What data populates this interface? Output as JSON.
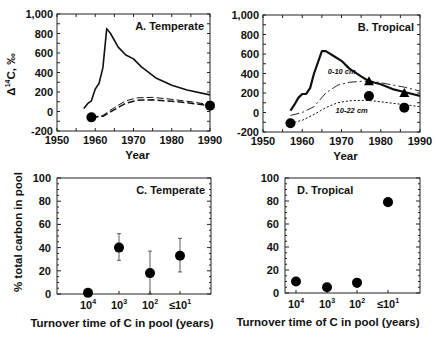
{
  "chart_data": [
    {
      "id": "A",
      "type": "line",
      "title": "A. Temperate",
      "xlabel": "Year",
      "ylabel": "Δ14C, ‰",
      "xlim": [
        1950,
        1990
      ],
      "ylim": [
        -200,
        1000
      ],
      "xticks": [
        "1950",
        "1960",
        "1970",
        "1980",
        "1990"
      ],
      "yticks": [
        "-200",
        "0",
        "200",
        "400",
        "600",
        "800",
        "1,000"
      ],
      "series": [
        {
          "name": "Atmospheric 14CO2",
          "style": "solid",
          "x": [
            1957,
            1958,
            1959,
            1960,
            1961,
            1962,
            1963,
            1964,
            1966,
            1968,
            1970,
            1972,
            1976,
            1980,
            1984,
            1990
          ],
          "y": [
            30,
            80,
            110,
            230,
            290,
            450,
            850,
            800,
            660,
            580,
            540,
            460,
            340,
            270,
            220,
            170
          ]
        },
        {
          "name": "Model pool (upper)",
          "style": "dashed-double",
          "x": [
            1959,
            1962,
            1965,
            1968,
            1971,
            1975,
            1980,
            1985,
            1990
          ],
          "y": [
            -60,
            -40,
            40,
            110,
            140,
            145,
            125,
            100,
            70
          ]
        },
        {
          "name": "Model pool (lower)",
          "style": "dashed",
          "x": [
            1959,
            1962,
            1965,
            1968,
            1971,
            1975,
            1980,
            1985,
            1990
          ],
          "y": [
            -60,
            -50,
            20,
            85,
            115,
            120,
            105,
            85,
            60
          ]
        },
        {
          "name": "Measured soil",
          "style": "marker-circle",
          "x": [
            1959,
            1990
          ],
          "y": [
            -60,
            60
          ]
        }
      ]
    },
    {
      "id": "B",
      "type": "line",
      "title": "B. Tropical",
      "xlabel": "Year",
      "ylabel": "",
      "xlim": [
        1950,
        1990
      ],
      "ylim": [
        -200,
        1000
      ],
      "xticks": [
        "1950",
        "1960",
        "1970",
        "1980",
        "1990"
      ],
      "yticks": [
        "-200",
        "0",
        "200",
        "400",
        "600",
        "800",
        "1,000"
      ],
      "annotations": [
        "0-10  cm",
        "10-22  cm"
      ],
      "series": [
        {
          "name": "Atmospheric 14CO2",
          "style": "solid-bold",
          "x": [
            1957,
            1958,
            1959,
            1960,
            1961,
            1962,
            1963,
            1965,
            1966,
            1968,
            1970,
            1972,
            1975,
            1977,
            1980,
            1983,
            1986,
            1990
          ],
          "y": [
            20,
            80,
            150,
            190,
            190,
            250,
            400,
            630,
            630,
            580,
            530,
            450,
            370,
            320,
            290,
            240,
            210,
            170
          ]
        },
        {
          "name": "0-10 cm model",
          "style": "long-dash",
          "x": [
            1957,
            1960,
            1963,
            1966,
            1969,
            1972,
            1975,
            1978,
            1982,
            1986,
            1990
          ],
          "y": [
            -30,
            0,
            60,
            200,
            280,
            310,
            320,
            320,
            290,
            260,
            220
          ]
        },
        {
          "name": "10-22 cm model",
          "style": "dotted",
          "x": [
            1957,
            1960,
            1963,
            1966,
            1969,
            1972,
            1975,
            1978,
            1982,
            1986,
            1990
          ],
          "y": [
            -110,
            -80,
            -20,
            50,
            100,
            120,
            125,
            120,
            100,
            80,
            60
          ]
        },
        {
          "name": "0-10 cm measured",
          "style": "marker-triangle",
          "x": [
            1977,
            1986
          ],
          "y": [
            320,
            200
          ]
        },
        {
          "name": "10-22 cm measured",
          "style": "marker-circle",
          "x": [
            1957,
            1977,
            1986
          ],
          "y": [
            -110,
            170,
            50
          ]
        }
      ]
    },
    {
      "id": "C",
      "type": "scatter",
      "title": "C. Temperate",
      "xlabel": "Turnover time of C in pool (years)",
      "ylabel": "% total carbon in pool",
      "ylim": [
        0,
        100
      ],
      "categories": [
        "10^4",
        "10^3",
        "10^2",
        "≤10^1"
      ],
      "values": [
        1,
        40,
        18,
        33
      ],
      "error_low": [
        0,
        29,
        0,
        19
      ],
      "error_high": [
        2,
        52,
        37,
        48
      ]
    },
    {
      "id": "D",
      "type": "scatter",
      "title": "D. Tropical",
      "xlabel": "Turnover time of C in pool (years)",
      "ylabel": "",
      "ylim": [
        0,
        100
      ],
      "categories": [
        "10^4",
        "10^3",
        "10^2",
        "≤10^1"
      ],
      "values": [
        10,
        5,
        9,
        79
      ],
      "error_low": [
        9,
        4,
        5,
        76
      ],
      "error_high": [
        11,
        6,
        12,
        83
      ]
    }
  ],
  "labels": {
    "A": {
      "title": "A. Temperate",
      "xlabel": "Year",
      "ylabel_main": "Δ",
      "ylabel_sup": "14",
      "ylabel_rest": "C, ‰"
    },
    "B": {
      "title": "B. Tropical",
      "xlabel": "Year",
      "annot_top": "0-10  cm",
      "annot_bottom": "10-22  cm"
    },
    "C": {
      "title": "C. Temperate",
      "xlabel": "Turnover time of C in pool (years)",
      "ylabel": "% total carbon in pool"
    },
    "D": {
      "title": "D. Tropical",
      "xlabel": "Turnover time of C in pool (years)"
    },
    "year_ticks": [
      "1950",
      "1960",
      "1970",
      "1980",
      "1990"
    ],
    "d14c_ticks": [
      "1,000",
      "800",
      "600",
      "400",
      "200",
      "0",
      "-200"
    ],
    "pct_ticks": [
      "100",
      "80",
      "60",
      "40",
      "20",
      "0"
    ],
    "turnover_ticks": [
      {
        "base": "10",
        "exp": "4"
      },
      {
        "base": "10",
        "exp": "3"
      },
      {
        "base": "10",
        "exp": "2"
      },
      {
        "base": "≤10",
        "exp": "1"
      }
    ]
  }
}
